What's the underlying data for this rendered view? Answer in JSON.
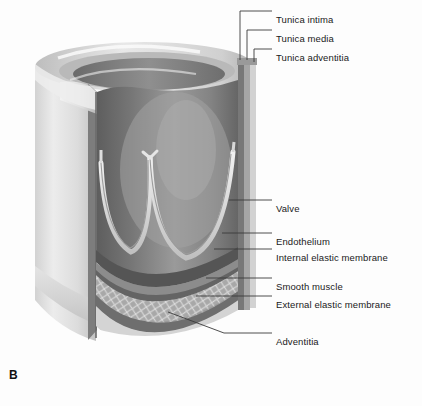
{
  "figure": {
    "panel_letter": "B",
    "background_color": "#fdfdfd",
    "line_color": "#3a3a3a",
    "text_color": "#1a1a1a"
  },
  "labels": [
    {
      "id": "tunica-intima",
      "text": "Tunica intima",
      "x": 276,
      "y": 14
    },
    {
      "id": "tunica-media",
      "text": "Tunica media",
      "x": 276,
      "y": 33
    },
    {
      "id": "tunica-adventitia",
      "text": "Tunica adventitia",
      "x": 276,
      "y": 52
    },
    {
      "id": "valve",
      "text": "Valve",
      "x": 276,
      "y": 203
    },
    {
      "id": "endothelium",
      "text": "Endothelium",
      "x": 276,
      "y": 236
    },
    {
      "id": "internal-elastic-membrane",
      "text": "Internal elastic membrane",
      "x": 276,
      "y": 252
    },
    {
      "id": "smooth-muscle",
      "text": "Smooth muscle",
      "x": 276,
      "y": 281
    },
    {
      "id": "external-elastic-membrane",
      "text": "External elastic membrane",
      "x": 276,
      "y": 299
    },
    {
      "id": "adventitia",
      "text": "Adventitia",
      "x": 276,
      "y": 336
    }
  ],
  "structures": {
    "vessel_wall_layers": [
      "Tunica intima",
      "Tunica media",
      "Tunica adventitia"
    ],
    "intima_components": [
      "Endothelium",
      "Internal elastic membrane"
    ],
    "media_components": [
      "Smooth muscle",
      "External elastic membrane"
    ],
    "adventitia_components": [
      "Adventitia"
    ],
    "lumen_structure": "Valve",
    "valve_cusps": 2
  },
  "colors": {
    "lumen_dark": "#6f6f6f",
    "lumen_mid": "#8e8e8e",
    "wall_outer_light": "#d9d9d9",
    "wall_outer_highlight": "#f0f0f0",
    "rim_top": "#c9c9c9",
    "endothelium_band": "#5c5c5c",
    "internal_elastic_band": "#6a6a6a",
    "smooth_muscle_band": "#a9a9a9",
    "external_elastic_band": "#787878",
    "adventitia_band": "#cfcfcf",
    "valve_leaflet": "#e2e2e2"
  }
}
